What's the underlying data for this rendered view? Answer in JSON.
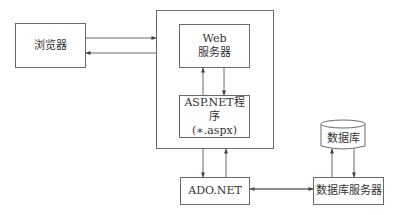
{
  "diagram": {
    "browser": {
      "label": "浏览器"
    },
    "web_server": {
      "line1": "Web",
      "line2": "服务器"
    },
    "aspnet_program": {
      "line1": "ASP.NET程序",
      "line2": "(∗.aspx)"
    },
    "ado_net": {
      "label": "ADO.NET"
    },
    "database": {
      "label": "数据库"
    },
    "db_server": {
      "label": "数据库服务器"
    },
    "colors": {
      "stroke": "#6a6a6a",
      "text": "#333333"
    }
  }
}
